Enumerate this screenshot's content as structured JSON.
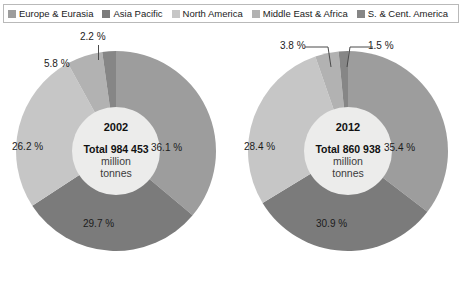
{
  "legend": {
    "items": [
      {
        "label": "Europe & Eurasia",
        "color": "#9d9d9d",
        "icon": "legend-swatch"
      },
      {
        "label": "Asia Pacific",
        "color": "#7b7b7b",
        "icon": "legend-swatch"
      },
      {
        "label": "North America",
        "color": "#c6c6c6",
        "icon": "legend-swatch"
      },
      {
        "label": "Middle East & Africa",
        "color": "#b2b2b2",
        "icon": "legend-swatch"
      },
      {
        "label": "S. & Cent. America",
        "color": "#868686",
        "icon": "legend-swatch"
      }
    ]
  },
  "chart_data": [
    {
      "type": "pie",
      "title": "2002",
      "total_label": "Total 984 453",
      "unit_line1": "million",
      "unit_line2": "tonnes",
      "total_value": 984453,
      "unit": "million tonnes",
      "categories": [
        "Europe & Eurasia",
        "Asia Pacific",
        "North America",
        "Middle East & Africa",
        "S. & Cent. America"
      ],
      "values": [
        36.1,
        29.7,
        26.2,
        5.8,
        2.2
      ],
      "value_labels": [
        "36.1 %",
        "29.7 %",
        "26.2 %",
        "5.8 %",
        "2.2 %"
      ],
      "colors": [
        "#9d9d9d",
        "#7b7b7b",
        "#c6c6c6",
        "#b2b2b2",
        "#868686"
      ],
      "donut": true,
      "legend_position": "top"
    },
    {
      "type": "pie",
      "title": "2012",
      "total_label": "Total 860 938",
      "unit_line1": "million",
      "unit_line2": "tonnes",
      "total_value": 860938,
      "unit": "million tonnes",
      "categories": [
        "Europe & Eurasia",
        "Asia Pacific",
        "North America",
        "Middle East & Africa",
        "S. & Cent. America"
      ],
      "values": [
        35.4,
        30.9,
        28.4,
        3.8,
        1.5
      ],
      "value_labels": [
        "35.4 %",
        "30.9 %",
        "28.4 %",
        "3.8 %",
        "1.5 %"
      ],
      "colors": [
        "#9d9d9d",
        "#7b7b7b",
        "#c6c6c6",
        "#b2b2b2",
        "#868686"
      ],
      "donut": true,
      "legend_position": "top"
    }
  ]
}
